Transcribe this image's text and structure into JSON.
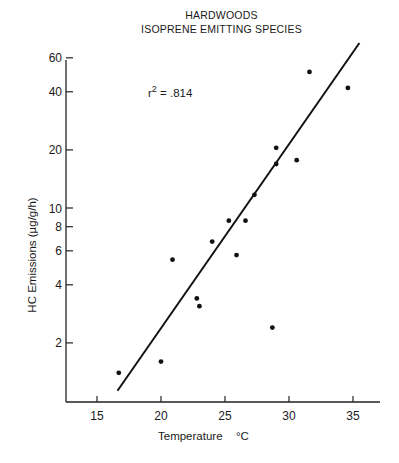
{
  "chart_data": {
    "type": "scatter",
    "title": "HARDWOODS",
    "subtitle": "ISOPRENE EMITTING SPECIES",
    "xlabel": "Temperature",
    "xlabel_unit": "°C",
    "ylabel": "HC Emissions (µg/g/h)",
    "yscale": "log",
    "xlim": [
      12.5,
      37
    ],
    "ylim": [
      1.0,
      60
    ],
    "x_ticks": [
      15,
      20,
      25,
      30,
      35
    ],
    "y_ticks": [
      2,
      4,
      6,
      8,
      10,
      20,
      40,
      60
    ],
    "grid": false,
    "annotation": {
      "text_base": "r",
      "superscript": "2",
      "text_value": " = .814"
    },
    "points": [
      {
        "x": 16.7,
        "y": 1.4
      },
      {
        "x": 20.0,
        "y": 1.6
      },
      {
        "x": 20.9,
        "y": 5.4
      },
      {
        "x": 22.8,
        "y": 3.4
      },
      {
        "x": 23.0,
        "y": 3.1
      },
      {
        "x": 24.0,
        "y": 6.7
      },
      {
        "x": 25.3,
        "y": 8.6
      },
      {
        "x": 25.9,
        "y": 5.7
      },
      {
        "x": 26.6,
        "y": 8.6
      },
      {
        "x": 27.3,
        "y": 11.7
      },
      {
        "x": 28.7,
        "y": 2.4
      },
      {
        "x": 29.0,
        "y": 20.5
      },
      {
        "x": 29.0,
        "y": 16.9
      },
      {
        "x": 30.6,
        "y": 17.7
      },
      {
        "x": 31.6,
        "y": 50.7
      },
      {
        "x": 34.6,
        "y": 41.9
      }
    ],
    "regression_line": {
      "x": [
        16.6,
        35.5
      ],
      "y": [
        1.13,
        71.6
      ],
      "r_squared": 0.814
    }
  }
}
